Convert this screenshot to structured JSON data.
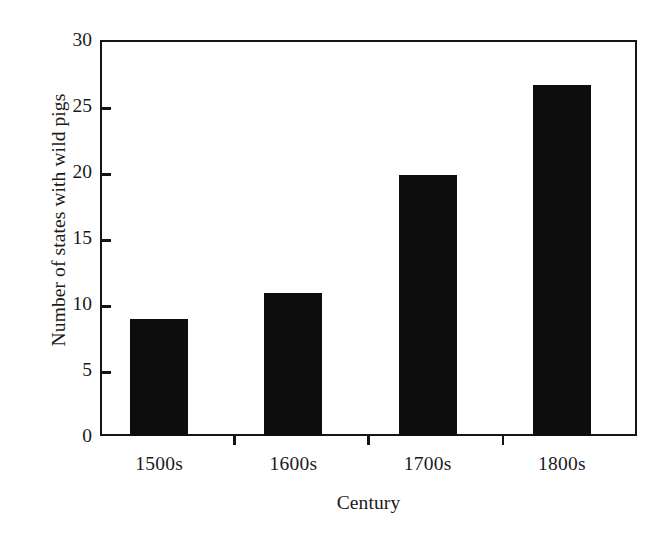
{
  "chart_data": {
    "type": "bar",
    "title": "",
    "subtitle": "",
    "xlabel": "Century",
    "ylabel": "Number of states with wild pigs",
    "categories": [
      "1500s",
      "1600s",
      "1700s",
      "1800s"
    ],
    "values": [
      8.9,
      10.8,
      19.8,
      26.6
    ],
    "series": [
      {
        "name": "Number of states with wild pigs",
        "values": [
          8.9,
          10.8,
          19.8,
          26.6
        ]
      }
    ],
    "ylim": [
      0,
      30
    ],
    "yticks": [
      0,
      5,
      10,
      15,
      20,
      25,
      30
    ],
    "ytick_labels": [
      "0",
      "5",
      "10",
      "15",
      "20",
      "25",
      "30"
    ],
    "xtick_labels": [
      "1500s",
      "1600s",
      "1700s",
      "1800s"
    ],
    "grid": false,
    "legend": false,
    "legend_position": "none",
    "bar_color": "#0d0d0d",
    "axis_color": "#151515",
    "background_color": "#ffffff",
    "annotations": []
  }
}
